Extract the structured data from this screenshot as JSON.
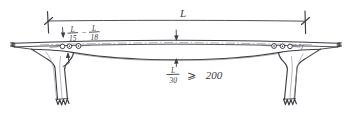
{
  "drawing": {
    "title": "Post-tensioned box girder bridge elevation sketch",
    "background_color": "#ffffff",
    "ink_color": "#3c3c44",
    "light_ink_color": "#9a9aa2"
  },
  "labels": {
    "span": {
      "symbol": "L",
      "name": "span-length-label"
    },
    "pier_depth": {
      "numerator_1": "L",
      "denominator_1": "15",
      "separator": "–",
      "numerator_2": "L",
      "denominator_2": "18"
    },
    "midspan_depth": {
      "numerator": "L",
      "denominator": "30",
      "relation": "⩾",
      "value": "200"
    }
  },
  "elements": {
    "deck_break_left": "break-line-left",
    "deck_break_right": "break-line-right",
    "pier_left": "pier-left",
    "pier_right": "pier-right",
    "ducts_left_count": 3,
    "ducts_right_count": 3,
    "dimension_line": "span-dimension-line",
    "centerline": "deck-centerline"
  }
}
